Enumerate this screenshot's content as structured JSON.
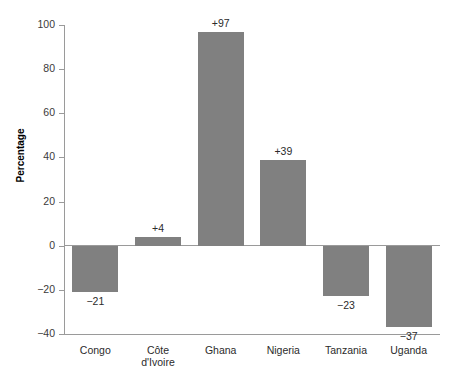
{
  "chart_data": {
    "type": "bar",
    "title": "",
    "xlabel": "",
    "ylabel": "Percentage",
    "categories": [
      "Congo",
      "Côte\nd'Ivoire",
      "Ghana",
      "Nigeria",
      "Tanzania",
      "Uganda"
    ],
    "values": [
      -21,
      4,
      97,
      39,
      -23,
      -37
    ],
    "data_labels": [
      "−21",
      "+4",
      "+97",
      "+39",
      "−23",
      "−37"
    ],
    "ylim": [
      -40,
      100
    ],
    "yticks": [
      -40,
      -20,
      0,
      20,
      40,
      60,
      80,
      100
    ],
    "ytick_labels": [
      "−40",
      "−20",
      "0",
      "20",
      "40",
      "60",
      "80",
      "100"
    ],
    "grid": false,
    "legend": null,
    "bar_color": "#808080",
    "axis_color": "#9a9a9a",
    "text_color": "#2b2b2b"
  }
}
